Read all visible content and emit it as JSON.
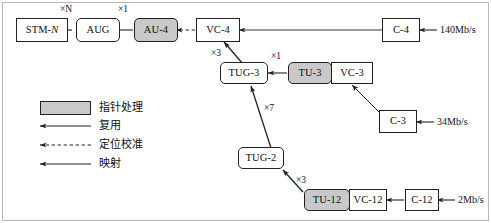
{
  "diagram": {
    "colors": {
      "pointer_fill": "#c9c9c9",
      "line": "#222222",
      "frame": "#b9b9b9"
    },
    "nodes": {
      "stm_n": "STM-N",
      "aug": "AUG",
      "au4": "AU-4",
      "vc4": "VC-4",
      "c4": "C-4",
      "tug3": "TUG-3",
      "tu3": "TU-3",
      "vc3": "VC-3",
      "c3": "C-3",
      "tug2": "TUG-2",
      "tu12": "TU-12",
      "vc12": "VC-12",
      "c12": "C-12"
    },
    "multipliers": {
      "stm_from_aug": "×N",
      "aug_from_au4": "×1",
      "tug3_from_vc4": "×3",
      "tug3_from_tu3": "×1",
      "tug3_from_tug2": "×7",
      "tug2_from_tu12": "×3"
    },
    "rates": {
      "c4": "140Mb/s",
      "c3": "34Mb/s",
      "c12": "2Mb/s"
    },
    "legend": {
      "pointer": "指针处理",
      "multiplex": "复用",
      "align": "定位校准",
      "map": "映射"
    }
  }
}
